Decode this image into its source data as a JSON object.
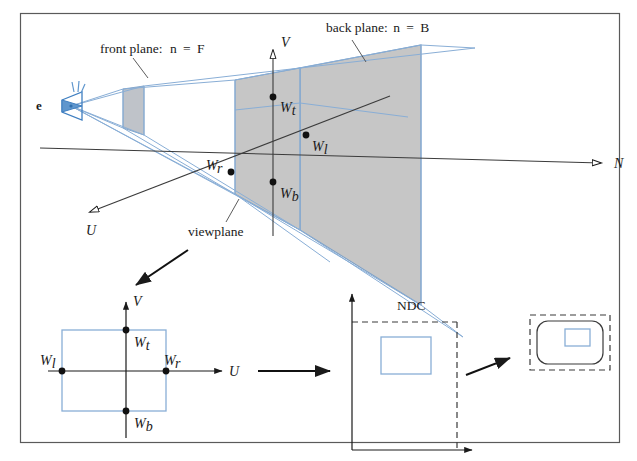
{
  "figure": {
    "title_alt": "Perspective view volume mapped to NDC and device",
    "frame": {
      "x": 20,
      "y": 13,
      "width": 600,
      "height": 430,
      "border_color": "#555555"
    },
    "colors": {
      "blue": "#89aed6",
      "blue_dark": "#6f99c4",
      "grey_fill": "#c6c6c6",
      "grey_fill_light": "#cfcfcf",
      "ink": "#1a1a1a",
      "frame": "#555555",
      "dash": "#3a3a3a"
    },
    "labels": {
      "front_plane": "front plane: n = F",
      "front_plane_text": "front plane:",
      "front_plane_n": "n",
      "front_plane_eq": "=",
      "front_plane_val": "F",
      "back_plane_text": "back plane:",
      "back_plane_n": "n",
      "back_plane_eq": "=",
      "back_plane_val": "B",
      "viewplane": "viewplane",
      "ndc": "NDC",
      "eye": "e",
      "axis_u": "U",
      "axis_v": "V",
      "axis_n": "N",
      "axis_u_bottom": "U",
      "axis_v_bottom": "V",
      "w_top": "W",
      "w_top_sub": "t",
      "w_bottom": "W",
      "w_bottom_sub": "b",
      "w_left": "W",
      "w_left_sub": "l",
      "w_right": "W",
      "w_right_sub": "r"
    },
    "points_3d": [
      {
        "name": "W_t",
        "x": 273,
        "y": 97,
        "label": "W",
        "sub": "t"
      },
      {
        "name": "W_b",
        "x": 273,
        "y": 182,
        "label": "W",
        "sub": "b"
      },
      {
        "name": "W_r",
        "x": 231,
        "y": 172,
        "label": "W",
        "sub": "r"
      },
      {
        "name": "W_l",
        "x": 306,
        "y": 135,
        "label": "W",
        "sub": "l"
      }
    ],
    "points_uv": [
      {
        "name": "W_t",
        "x": 126,
        "y": 330,
        "label": "W",
        "sub": "t"
      },
      {
        "name": "W_b",
        "x": 126,
        "y": 411,
        "label": "W",
        "sub": "b"
      },
      {
        "name": "W_l",
        "x": 62,
        "y": 371,
        "label": "W",
        "sub": "l"
      },
      {
        "name": "W_r",
        "x": 166,
        "y": 371,
        "label": "W",
        "sub": "r"
      }
    ],
    "panels": {
      "uv_panel": {
        "rect_x": 62,
        "rect_y": 330,
        "rect_w": 104,
        "rect_h": 81
      },
      "ndc_panel": {
        "dash_x": 352,
        "dash_y": 322,
        "dash_w": 105,
        "dash_h": 128,
        "inner_x": 381,
        "inner_y": 337,
        "inner_w": 50,
        "inner_h": 37
      },
      "device_panel": {
        "dash_x": 530,
        "dash_y": 315,
        "dash_w": 80,
        "dash_h": 55,
        "inner_x": 565,
        "inner_y": 329,
        "inner_w": 25,
        "inner_h": 17
      }
    }
  }
}
